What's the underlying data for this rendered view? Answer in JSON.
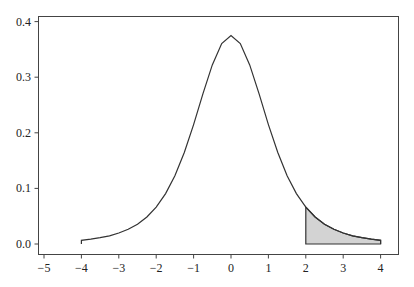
{
  "chart_data": {
    "type": "line",
    "title": "",
    "xlabel": "",
    "ylabel": "",
    "xlim": [
      -5.2,
      4.45
    ],
    "ylim": [
      -0.018,
      0.42
    ],
    "grid": false,
    "legend": null,
    "x_ticks": [
      -5,
      -4,
      -3,
      -2,
      -1,
      0,
      1,
      2,
      3,
      4
    ],
    "x_tick_labels": [
      "−5",
      "−4",
      "−3",
      "−2",
      "−1",
      "0",
      "1",
      "2",
      "3",
      "4"
    ],
    "y_ticks": [
      0.0,
      0.1,
      0.2,
      0.3,
      0.4
    ],
    "y_tick_labels": [
      "0.0",
      "0.1",
      "0.2",
      "0.3",
      "0.4"
    ],
    "series": [
      {
        "name": "density",
        "color": "#333333",
        "x": [
          -4,
          -3.75,
          -3.5,
          -3.25,
          -3,
          -2.75,
          -2.5,
          -2.25,
          -2,
          -1.75,
          -1.5,
          -1.25,
          -1,
          -0.75,
          -0.5,
          -0.25,
          0,
          0.25,
          0.5,
          0.75,
          1,
          1.25,
          1.5,
          1.75,
          2,
          2.25,
          2.5,
          2.75,
          3,
          3.25,
          3.5,
          3.75,
          4
        ],
        "y": [
          0.0067,
          0.0087,
          0.0113,
          0.0148,
          0.0197,
          0.0264,
          0.0357,
          0.0486,
          0.0663,
          0.0906,
          0.1229,
          0.1645,
          0.2147,
          0.2699,
          0.3222,
          0.3607,
          0.375,
          0.3607,
          0.3222,
          0.2699,
          0.2147,
          0.1645,
          0.1229,
          0.0906,
          0.0663,
          0.0486,
          0.0357,
          0.0264,
          0.0197,
          0.0148,
          0.0113,
          0.0087,
          0.0067
        ]
      }
    ],
    "shaded_region": {
      "x_from": 2,
      "x_to": 4,
      "fill": "#d3d3d3",
      "edge": "#333333"
    }
  }
}
